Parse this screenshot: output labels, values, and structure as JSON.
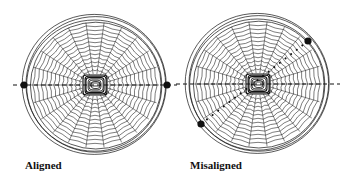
{
  "panels": [
    {
      "id": "aligned",
      "label": "Aligned",
      "center": [
        95,
        85
      ],
      "radius": 72,
      "axis": {
        "style": "dashed",
        "angle_deg": 0
      },
      "markers": [
        [
          24,
          85
        ],
        [
          167,
          85
        ]
      ],
      "marker_line": {
        "style": "dashed",
        "from": [
          24,
          85
        ],
        "to": [
          167,
          85
        ]
      }
    },
    {
      "id": "misaligned",
      "label": "Misaligned",
      "center": [
        258,
        84
      ],
      "radius": 72,
      "axis": {
        "style": "dashed",
        "angle_deg": 0
      },
      "markers": [
        [
          308,
          41
        ],
        [
          201,
          124
        ]
      ],
      "marker_line": {
        "style": "dotted",
        "from": [
          308,
          41
        ],
        "to": [
          201,
          124
        ]
      }
    }
  ],
  "colors": {
    "ink": "#111111",
    "background": "#ffffff"
  }
}
